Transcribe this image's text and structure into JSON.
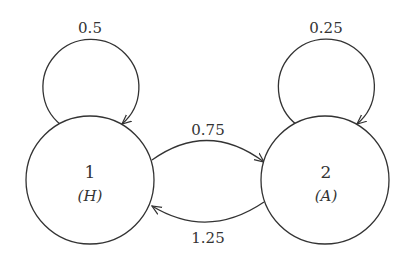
{
  "diagram": {
    "type": "state-transition",
    "nodes": [
      {
        "id": "1",
        "number": "1",
        "label": "(H)"
      },
      {
        "id": "2",
        "number": "2",
        "label": "(A)"
      }
    ],
    "edges": [
      {
        "from": "1",
        "to": "1",
        "weight": "0.5"
      },
      {
        "from": "2",
        "to": "2",
        "weight": "0.25"
      },
      {
        "from": "1",
        "to": "2",
        "weight": "0.75"
      },
      {
        "from": "2",
        "to": "1",
        "weight": "1.25"
      }
    ],
    "colors": {
      "stroke": "#333333",
      "fill": "#ffffff",
      "text": "#333333"
    }
  }
}
